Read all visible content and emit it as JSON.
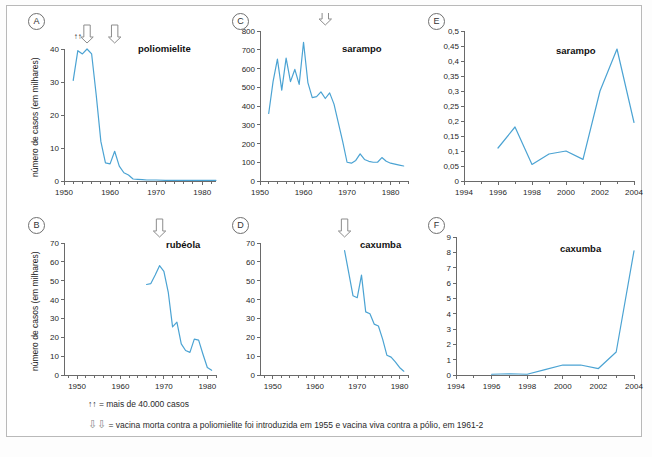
{
  "figure": {
    "line_color": "#4ba3d3",
    "axis_color": "#6a6a6a",
    "arrow_color": "#8c8c8c"
  },
  "axis_titles": {
    "y_cases": "número de casos (em milhares)"
  },
  "footnotes": [
    {
      "symbol": "↑↑",
      "text": "= mais de 40.000 casos"
    },
    {
      "symbol": "⇩⇩",
      "text": "= vacina morta contra a poliomielite foi introduzida em 1955 e vacina viva contra a pólio, em 1961-2"
    }
  ],
  "chart_data": [
    {
      "panel": "A",
      "type": "line",
      "title": "poliomielite",
      "xlabel": "",
      "ylabel": "número de casos (em milhares)",
      "xlim": [
        1950,
        1983
      ],
      "ylim": [
        0,
        40
      ],
      "yticks": [
        0,
        10,
        20,
        30,
        40
      ],
      "ytick_labels": [
        "0",
        "10",
        "20",
        "30",
        "40"
      ],
      "xticks": [
        1950,
        1960,
        1970,
        1980
      ],
      "xtick_labels": [
        "1950",
        "1960",
        "1970",
        "1980"
      ],
      "x": [
        1952,
        1953,
        1954,
        1955,
        1956,
        1957,
        1958,
        1959,
        1960,
        1961,
        1962,
        1963,
        1964,
        1965,
        1966,
        1967,
        1968,
        1970,
        1972,
        1975,
        1978,
        1980,
        1983
      ],
      "values": [
        30.5,
        39.5,
        38.5,
        40.0,
        38.5,
        26.0,
        12.0,
        5.5,
        5.2,
        9.0,
        4.5,
        2.5,
        1.8,
        0.6,
        0.5,
        0.4,
        0.3,
        0.3,
        0.2,
        0.2,
        0.2,
        0.2,
        0.2
      ],
      "annotations": [
        {
          "kind": "up-arrows",
          "symbol": "↑↑",
          "at_x": 1953,
          "note": "mais de 40.000 casos"
        },
        {
          "kind": "down-arrow",
          "at_x": 1955,
          "note": "vacina morta 1955"
        },
        {
          "kind": "down-arrow",
          "at_x": 1961,
          "note": "vacina viva 1961-2"
        }
      ]
    },
    {
      "panel": "B",
      "type": "line",
      "title": "rubéola",
      "xlabel": "",
      "ylabel": "número de casos (em milhares)",
      "xlim": [
        1947,
        1982
      ],
      "ylim": [
        0,
        70
      ],
      "yticks": [
        0,
        10,
        20,
        30,
        40,
        50,
        60,
        70
      ],
      "ytick_labels": [
        "0",
        "10",
        "20",
        "30",
        "40",
        "50",
        "60",
        "70"
      ],
      "xticks": [
        1950,
        1960,
        1970,
        1980
      ],
      "xtick_labels": [
        "1950",
        "1960",
        "1970",
        "1980"
      ],
      "x": [
        1966,
        1967,
        1968,
        1969,
        1970,
        1971,
        1972,
        1973,
        1974,
        1975,
        1976,
        1977,
        1978,
        1979,
        1980,
        1981
      ],
      "values": [
        48.0,
        48.5,
        53.0,
        58.0,
        55.0,
        44.0,
        25.5,
        28.0,
        16.5,
        13.0,
        12.0,
        19.0,
        18.5,
        11.0,
        4.0,
        2.5
      ],
      "annotations": [
        {
          "kind": "down-arrow",
          "at_x": 1969,
          "note": "vacina"
        }
      ]
    },
    {
      "panel": "C",
      "type": "line",
      "title": "sarampo",
      "xlabel": "",
      "ylabel": "",
      "xlim": [
        1950,
        1984
      ],
      "ylim": [
        0,
        800
      ],
      "yticks": [
        0,
        100,
        200,
        300,
        400,
        500,
        600,
        700,
        800
      ],
      "ytick_labels": [
        "0",
        "100",
        "200",
        "300",
        "400",
        "500",
        "600",
        "700",
        "800"
      ],
      "xticks": [
        1950,
        1960,
        1970,
        1980
      ],
      "xtick_labels": [
        "1950",
        "1960",
        "1970",
        "1980"
      ],
      "x": [
        1952,
        1953,
        1954,
        1955,
        1956,
        1957,
        1958,
        1959,
        1960,
        1961,
        1962,
        1963,
        1964,
        1965,
        1966,
        1967,
        1968,
        1969,
        1970,
        1971,
        1972,
        1973,
        1974,
        1975,
        1976,
        1977,
        1978,
        1979,
        1980,
        1981,
        1982,
        1983
      ],
      "values": [
        360,
        530,
        650,
        485,
        655,
        530,
        595,
        515,
        740,
        525,
        445,
        450,
        475,
        440,
        470,
        410,
        310,
        210,
        100,
        95,
        110,
        145,
        115,
        105,
        100,
        100,
        125,
        105,
        95,
        90,
        85,
        80
      ],
      "annotations": [
        {
          "kind": "down-arrow",
          "at_x": 1965,
          "note": "vacina"
        }
      ]
    },
    {
      "panel": "D",
      "type": "line",
      "title": "caxumba",
      "xlabel": "",
      "ylabel": "",
      "xlim": [
        1947,
        1982
      ],
      "ylim": [
        0,
        70
      ],
      "yticks": [
        0,
        10,
        20,
        30,
        40,
        50,
        60,
        70
      ],
      "ytick_labels": [
        "0",
        "10",
        "20",
        "30",
        "40",
        "50",
        "60",
        "70"
      ],
      "xticks": [
        1950,
        1960,
        1970,
        1980
      ],
      "xtick_labels": [
        "1950",
        "1960",
        "1970",
        "1980"
      ],
      "x": [
        1967,
        1968,
        1969,
        1970,
        1971,
        1972,
        1973,
        1974,
        1975,
        1976,
        1977,
        1978,
        1979,
        1980,
        1981
      ],
      "values": [
        66.0,
        54.0,
        42.0,
        41.0,
        53.0,
        33.5,
        32.5,
        27.0,
        26.0,
        19.0,
        10.5,
        9.5,
        7.0,
        4.0,
        2.0
      ],
      "annotations": [
        {
          "kind": "down-arrow",
          "at_x": 1967,
          "note": "vacina"
        }
      ]
    },
    {
      "panel": "E",
      "type": "line",
      "title": "sarampo",
      "xlabel": "",
      "ylabel": "",
      "xlim": [
        1994,
        2004
      ],
      "ylim": [
        0,
        0.5
      ],
      "yticks": [
        0,
        0.05,
        0.1,
        0.15,
        0.2,
        0.25,
        0.3,
        0.35,
        0.4,
        0.45,
        0.5
      ],
      "ytick_labels": [
        "0",
        "0,05",
        "0,1",
        "0,15",
        "0,2",
        "0,25",
        "0,3",
        "0,35",
        "0,4",
        "0,45",
        "0,5"
      ],
      "xticks": [
        1994,
        1996,
        1998,
        2000,
        2002,
        2004
      ],
      "xtick_labels": [
        "1994",
        "1996",
        "1998",
        "2000",
        "2002",
        "2004"
      ],
      "x": [
        1996,
        1997,
        1998,
        1999,
        2000,
        2001,
        2002,
        2003,
        2004
      ],
      "values": [
        0.11,
        0.18,
        0.055,
        0.09,
        0.1,
        0.072,
        0.3,
        0.44,
        0.195
      ],
      "annotations": []
    },
    {
      "panel": "F",
      "type": "line",
      "title": "caxumba",
      "xlabel": "",
      "ylabel": "",
      "xlim": [
        1994,
        2004
      ],
      "ylim": [
        0,
        9
      ],
      "yticks": [
        0,
        1,
        2,
        3,
        4,
        5,
        6,
        7,
        8,
        9
      ],
      "ytick_labels": [
        "0",
        "1",
        "2",
        "3",
        "4",
        "5",
        "6",
        "7",
        "8",
        "9"
      ],
      "xticks": [
        1994,
        1996,
        1998,
        2000,
        2002,
        2004
      ],
      "xtick_labels": [
        "1994",
        "1996",
        "1998",
        "2000",
        "2002",
        "2004"
      ],
      "x": [
        1996,
        1997,
        1998,
        1999,
        2000,
        2001,
        2002,
        2003,
        2004
      ],
      "values": [
        0.05,
        0.08,
        0.05,
        0.35,
        0.65,
        0.65,
        0.42,
        1.5,
        8.1
      ],
      "annotations": []
    }
  ]
}
